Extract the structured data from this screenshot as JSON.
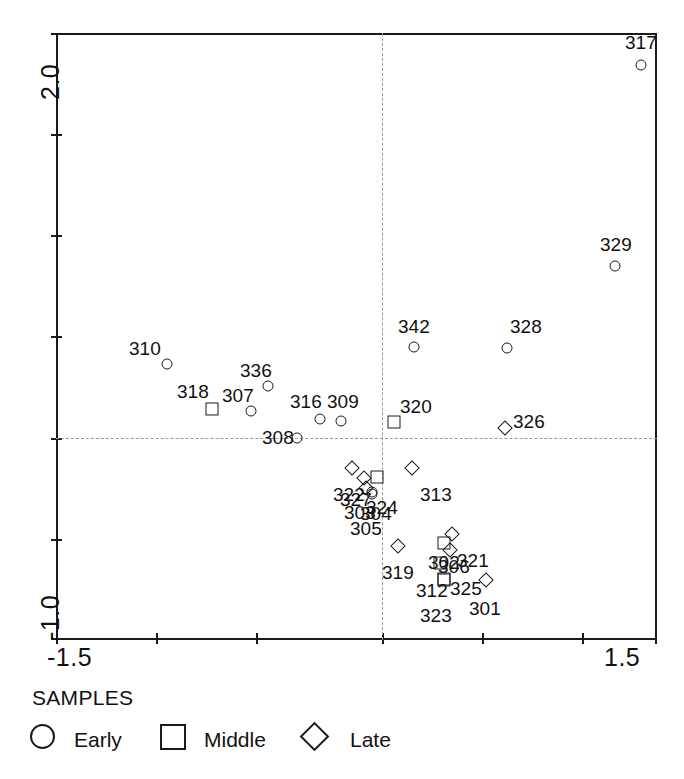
{
  "chart_data": {
    "type": "scatter",
    "title": "",
    "xlabel": "",
    "ylabel": "",
    "xlim": [
      -1.5,
      1.5
    ],
    "ylim": [
      -1.0,
      2.0
    ],
    "xticks": [
      -1.5,
      -1.0,
      -0.5,
      0.0,
      0.5,
      1.0,
      1.5
    ],
    "yticks": [
      -1.0,
      -0.5,
      0.0,
      0.5,
      1.0,
      1.5,
      2.0
    ],
    "xtick_labels_shown": [
      "-1.5",
      "1.5"
    ],
    "ytick_labels_shown": [
      "2.0",
      "-1.0"
    ],
    "grid": false,
    "reference_lines": {
      "vertical_x": 0.0,
      "horizontal_y": 0.0,
      "style": "dotted"
    },
    "legend": {
      "position": "below-plot",
      "title": "SAMPLES"
    },
    "series": [
      {
        "name": "Early",
        "marker": "circle"
      },
      {
        "name": "Middle",
        "marker": "square"
      },
      {
        "name": "Late",
        "marker": "diamond"
      }
    ],
    "points": [
      {
        "label": "317",
        "x": 1.46,
        "y": 1.925,
        "series": "Early",
        "px": 641,
        "py": 65,
        "lx": 625,
        "ly": 32
      },
      {
        "label": "329",
        "x": 1.33,
        "y": 1.15,
        "series": "Early",
        "px": 615,
        "py": 266,
        "lx": 600,
        "ly": 234
      },
      {
        "label": "328",
        "x": 1.04,
        "y": 0.81,
        "series": "Early",
        "px": 507,
        "py": 348,
        "lx": 510,
        "ly": 316
      },
      {
        "label": "342",
        "x": 0.15,
        "y": 0.8,
        "series": "Early",
        "px": 414,
        "py": 347,
        "lx": 398,
        "ly": 316
      },
      {
        "label": "310",
        "x": -1.13,
        "y": 0.7,
        "series": "Early",
        "px": 167,
        "py": 364,
        "lx": 129,
        "ly": 338
      },
      {
        "label": "336",
        "x": -0.63,
        "y": 0.56,
        "series": "Early",
        "px": 268,
        "py": 386,
        "lx": 240,
        "ly": 360
      },
      {
        "label": "318",
        "x": -0.78,
        "y": 0.43,
        "series": "Middle",
        "px": 212,
        "py": 409,
        "lx": 177,
        "ly": 381
      },
      {
        "label": "307",
        "x": -0.68,
        "y": 0.39,
        "series": "Early",
        "px": 251,
        "py": 411,
        "lx": 222,
        "ly": 385
      },
      {
        "label": "316",
        "x": -0.41,
        "y": 0.33,
        "series": "Early",
        "px": 320,
        "py": 419,
        "lx": 290,
        "ly": 391
      },
      {
        "label": "309",
        "x": -0.36,
        "y": 0.32,
        "series": "Early",
        "px": 341,
        "py": 421,
        "lx": 327,
        "ly": 391
      },
      {
        "label": "326",
        "x": 1.01,
        "y": 0.15,
        "series": "Late",
        "px": 505,
        "py": 428,
        "lx": 513,
        "ly": 411
      },
      {
        "label": "320",
        "x": 0.06,
        "y": 0.2,
        "series": "Middle",
        "px": 394,
        "py": 422,
        "lx": 400,
        "ly": 396
      },
      {
        "label": "308",
        "x": -0.43,
        "y": 0.01,
        "series": "Early",
        "px": 297,
        "py": 438,
        "lx": 262,
        "ly": 427
      },
      {
        "label": "322",
        "x": -0.16,
        "y": -0.16,
        "series": "Late",
        "px": 352,
        "py": 468,
        "lx": 333,
        "ly": 484
      },
      {
        "label": "327",
        "x": -0.09,
        "y": -0.23,
        "series": "Late",
        "px": 364,
        "py": 478,
        "lx": 340,
        "ly": 489
      },
      {
        "label": "324",
        "x": -0.03,
        "y": -0.23,
        "series": "Middle",
        "px": 377,
        "py": 477,
        "lx": 366,
        "ly": 497
      },
      {
        "label": "303",
        "x": -0.08,
        "y": -0.28,
        "series": "Late",
        "px": 366,
        "py": 488,
        "lx": 344,
        "ly": 502
      },
      {
        "label": "304",
        "x": -0.05,
        "y": -0.3,
        "series": "Early",
        "px": 372,
        "py": 492,
        "lx": 360,
        "ly": 503
      },
      {
        "label": "305",
        "x": -0.05,
        "y": -0.32,
        "series": "Early",
        "px": 372,
        "py": 494,
        "lx": 350,
        "ly": 518
      },
      {
        "label": "313",
        "x": 0.13,
        "y": -0.17,
        "series": "Late",
        "px": 412,
        "py": 468,
        "lx": 420,
        "ly": 484
      },
      {
        "label": "319",
        "x": 0.1,
        "y": -0.46,
        "series": "Late",
        "px": 398,
        "py": 546,
        "lx": 382,
        "ly": 562
      },
      {
        "label": "321",
        "x": 0.42,
        "y": -0.4,
        "series": "Late",
        "px": 452,
        "py": 534,
        "lx": 457,
        "ly": 550
      },
      {
        "label": "302",
        "x": 0.38,
        "y": -0.44,
        "series": "Middle",
        "px": 444,
        "py": 543,
        "lx": 428,
        "ly": 552
      },
      {
        "label": "306",
        "x": 0.41,
        "y": -0.47,
        "series": "Late",
        "px": 450,
        "py": 550,
        "lx": 438,
        "ly": 556
      },
      {
        "label": "325",
        "x": 0.36,
        "y": -0.54,
        "series": "Middle",
        "px": 440,
        "py": 563,
        "lx": 450,
        "ly": 578
      },
      {
        "label": "312",
        "x": 0.37,
        "y": -0.62,
        "series": "Middle",
        "px": 444,
        "py": 579,
        "lx": 416,
        "ly": 580
      },
      {
        "label": "323",
        "x": 0.37,
        "y": -0.64,
        "series": "Middle",
        "px": 444,
        "py": 580,
        "lx": 420,
        "ly": 605
      },
      {
        "label": "301",
        "x": 0.62,
        "y": -0.65,
        "series": "Late",
        "px": 486,
        "py": 580,
        "lx": 469,
        "ly": 598
      }
    ]
  },
  "axes": {
    "y_top_label": "2.0",
    "y_bottom_label": "-1.0",
    "x_left_label": "-1.5",
    "x_right_label": "1.5"
  },
  "legend": {
    "title": "SAMPLES",
    "items": [
      {
        "label": "Early",
        "marker": "circle-marker-icon"
      },
      {
        "label": "Middle",
        "marker": "square-marker-icon"
      },
      {
        "label": "Late",
        "marker": "diamond-marker-icon"
      }
    ]
  }
}
